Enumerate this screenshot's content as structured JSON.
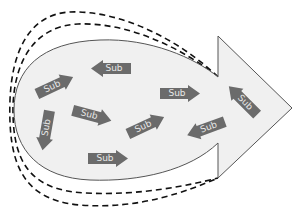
{
  "diagram": {
    "colors": {
      "body_fill": "#f0f0f0",
      "outline": "#555555",
      "dashed": "#111111",
      "arrow_fill": "#6b6b6b",
      "arrow_text": "#e8e8e8"
    },
    "sub_arrows": [
      {
        "label": "Sub",
        "x": 35,
        "y": 77,
        "rotate": -25
      },
      {
        "label": "Sub",
        "x": 91,
        "y": 60,
        "rotate": 180
      },
      {
        "label": "Sub",
        "x": 26,
        "y": 122,
        "rotate": 100
      },
      {
        "label": "Sub",
        "x": 72,
        "y": 107,
        "rotate": 15
      },
      {
        "label": "Sub",
        "x": 88,
        "y": 150,
        "rotate": 0
      },
      {
        "label": "Sub",
        "x": 126,
        "y": 117,
        "rotate": -25
      },
      {
        "label": "Sub",
        "x": 160,
        "y": 85,
        "rotate": 0
      },
      {
        "label": "Sub",
        "x": 186,
        "y": 120,
        "rotate": 160
      },
      {
        "label": "Sub",
        "x": 223,
        "y": 92,
        "rotate": -135
      }
    ]
  }
}
